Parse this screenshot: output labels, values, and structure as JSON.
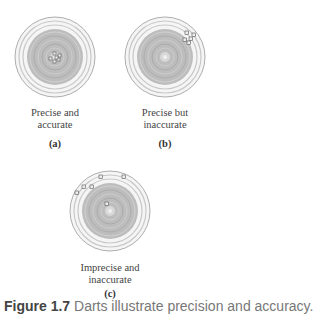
{
  "panels": [
    {
      "id": "a",
      "title_line1": "Precise and",
      "title_line2": "accurate",
      "letter": "(a)",
      "shots": [
        [
          0,
          -3
        ],
        [
          -4,
          1
        ],
        [
          3,
          2
        ],
        [
          -1,
          4
        ],
        [
          4,
          -2
        ],
        [
          1,
          0
        ]
      ]
    },
    {
      "id": "b",
      "title_line1": "Precise but",
      "title_line2": "inaccurate",
      "letter": "(b)",
      "shots": [
        [
          22,
          -24
        ],
        [
          26,
          -19
        ],
        [
          20,
          -18
        ],
        [
          29,
          -22
        ],
        [
          24,
          -15
        ]
      ]
    },
    {
      "id": "c",
      "title_line1": "Imprecise and",
      "title_line2": "inaccurate",
      "letter": "(c)",
      "shots": [
        [
          -33,
          -18
        ],
        [
          -26,
          -24
        ],
        [
          -18,
          -24
        ],
        [
          -9,
          -34
        ],
        [
          14,
          -34
        ],
        [
          -3,
          -7
        ]
      ]
    }
  ],
  "caption": {
    "figure": "Figure 1.7",
    "text": "Darts illustrate precision and accuracy."
  },
  "colors": {
    "target_outer": "#f2f2f2",
    "target_ring": "#d6d6d6",
    "target_inner": "#b0b0b0",
    "bullseye": "#e6e6e6",
    "shot": "#666666"
  }
}
